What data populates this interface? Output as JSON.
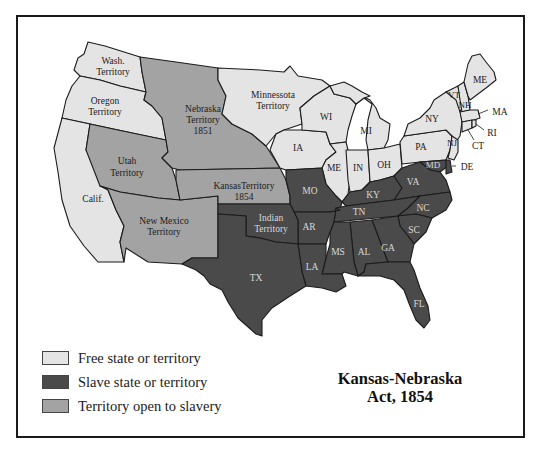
{
  "map": {
    "title_line1": "Kansas-Nebraska",
    "title_line2": "Act, 1854",
    "colors": {
      "free": "#e4e4e4",
      "slave": "#4a4a4a",
      "open": "#a3a3a3",
      "border": "#1b1b1b"
    },
    "legend": [
      {
        "label": "Free state or territory",
        "category": "free"
      },
      {
        "label": "Slave state or territory",
        "category": "slave"
      },
      {
        "label": "Territory open to slavery",
        "category": "open"
      }
    ],
    "regions": {
      "wash": {
        "line1": "Wash.",
        "line2": "Territory",
        "category": "free"
      },
      "oregon": {
        "line1": "Oregon",
        "line2": "Territory",
        "category": "free"
      },
      "calif": {
        "line1": "Calif.",
        "category": "free"
      },
      "utah": {
        "line1": "Utah",
        "line2": "Territory",
        "category": "open"
      },
      "new_mexico": {
        "line1": "New Mexico",
        "line2": "Territory",
        "category": "open"
      },
      "nebraska": {
        "line1": "Nebraska",
        "line2": "Territory",
        "line3": "1851",
        "category": "open"
      },
      "kansas": {
        "line1": "KansasTerritory",
        "line2": "1854",
        "category": "open"
      },
      "minnesota": {
        "line1": "Minnessota",
        "line2": "Territory",
        "category": "free"
      },
      "indian": {
        "line1": "Indian",
        "line2": "Territory",
        "category": "slave"
      },
      "tx": {
        "line1": "TX",
        "category": "slave"
      },
      "ia": {
        "line1": "IA",
        "category": "free"
      },
      "wi": {
        "line1": "WI",
        "category": "free"
      },
      "mi": {
        "line1": "MI",
        "category": "free"
      },
      "il": {
        "line1": "ME",
        "category": "free"
      },
      "in": {
        "line1": "IN",
        "category": "free"
      },
      "oh": {
        "line1": "OH",
        "category": "free"
      },
      "pa": {
        "line1": "PA",
        "category": "free"
      },
      "ny": {
        "line1": "NY",
        "category": "free"
      },
      "vt": {
        "line1": "VT",
        "category": "free"
      },
      "nh": {
        "line1": "NH",
        "category": "free"
      },
      "me": {
        "line1": "ME",
        "category": "free"
      },
      "ma": {
        "line1": "MA",
        "category": "free"
      },
      "ri": {
        "line1": "RI",
        "category": "free"
      },
      "ct": {
        "line1": "CT",
        "category": "free"
      },
      "nj": {
        "line1": "NJ",
        "category": "free"
      },
      "de": {
        "line1": "DE",
        "category": "slave"
      },
      "md": {
        "line1": "MD",
        "category": "slave"
      },
      "mo": {
        "line1": "MO",
        "category": "slave"
      },
      "ky": {
        "line1": "KY",
        "category": "slave"
      },
      "va": {
        "line1": "VA",
        "category": "slave"
      },
      "nc": {
        "line1": "NC",
        "category": "slave"
      },
      "tn": {
        "line1": "TN",
        "category": "slave"
      },
      "ar": {
        "line1": "AR",
        "category": "slave"
      },
      "sc": {
        "line1": "SC",
        "category": "slave"
      },
      "ga": {
        "line1": "GA",
        "category": "slave"
      },
      "al": {
        "line1": "AL",
        "category": "slave"
      },
      "ms": {
        "line1": "MS",
        "category": "slave"
      },
      "la": {
        "line1": "LA",
        "category": "slave"
      },
      "fl": {
        "line1": "FL",
        "category": "slave"
      }
    }
  }
}
